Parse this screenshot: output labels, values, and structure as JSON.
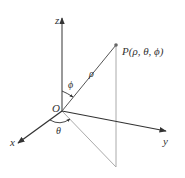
{
  "diagram": {
    "labels": {
      "z_axis": "z",
      "x_axis": "x",
      "y_axis": "y",
      "origin": "O",
      "point": "P(ρ, θ, ϕ)",
      "rho": "ρ",
      "phi": "ϕ",
      "theta": "θ"
    },
    "colors": {
      "axis": "#333333",
      "guide": "#aaaaaa",
      "point": "#666666",
      "background": "#ffffff"
    }
  }
}
